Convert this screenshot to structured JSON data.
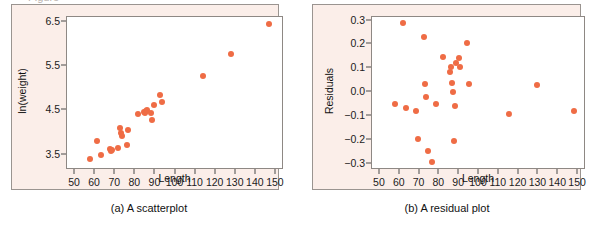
{
  "figure": {
    "background_color": "#ffffff",
    "panel_background_color": "#fbeee9",
    "plot_area_color": "#ffffff",
    "marker_color": "#ef6c45",
    "frame_color": "#9a9490"
  },
  "panels": [
    {
      "id": "scatterplot",
      "caption": "(a) A scatterplot",
      "chart_data": {
        "type": "scatter",
        "title": "",
        "xlabel": "Length",
        "ylabel": "ln(weight)",
        "xlim": [
          46,
          154
        ],
        "ylim": [
          3.15,
          6.62
        ],
        "grid": false,
        "legend": "none",
        "xticks": [
          50,
          60,
          70,
          80,
          90,
          100,
          110,
          120,
          130,
          140,
          150
        ],
        "yticks": [
          3.5,
          4.5,
          5.5,
          6.5
        ],
        "x": [
          57.5,
          61.0,
          63.0,
          67.5,
          68.0,
          68.5,
          71.5,
          72.5,
          73.0,
          73.5,
          76.0,
          76.5,
          81.5,
          84.5,
          85.0,
          85.5,
          86.0,
          88.0,
          88.5,
          89.5,
          92.5,
          93.5,
          113.5,
          127.5,
          146.5
        ],
        "y": [
          3.39,
          3.8,
          3.5,
          3.63,
          3.59,
          3.61,
          3.65,
          4.1,
          4.0,
          3.92,
          3.72,
          4.05,
          4.42,
          4.46,
          4.45,
          4.48,
          4.52,
          4.45,
          4.29,
          4.62,
          4.85,
          4.7,
          5.29,
          5.78,
          6.47
        ]
      }
    },
    {
      "id": "residual-plot",
      "caption": "(b) A residual plot",
      "chart_data": {
        "type": "scatter",
        "title": "",
        "xlabel": "Length",
        "ylabel": "Residuals",
        "xlim": [
          46,
          154
        ],
        "ylim": [
          -0.325,
          0.315
        ],
        "grid": false,
        "legend": "none",
        "xticks": [
          50,
          60,
          70,
          80,
          90,
          100,
          110,
          120,
          130,
          140,
          150
        ],
        "yticks": [
          "0.3",
          "0.2",
          "0.1",
          "0.0",
          "−0.1",
          "−0.2",
          "−0.3"
        ],
        "ytick_values": [
          0.3,
          0.2,
          0.1,
          0.0,
          -0.1,
          -0.2,
          -0.3
        ],
        "x": [
          57.5,
          61.5,
          63.0,
          68.0,
          69.0,
          72.0,
          72.5,
          73.0,
          74.5,
          76.5,
          78.5,
          82.0,
          85.5,
          86.0,
          86.5,
          87.0,
          87.5,
          88.0,
          88.5,
          90.0,
          90.5,
          94.0,
          95.0,
          115.0,
          129.5,
          148.0
        ],
        "y": [
          -0.051,
          0.29,
          -0.067,
          -0.077,
          -0.197,
          0.23,
          0.035,
          -0.021,
          -0.246,
          -0.29,
          -0.048,
          0.147,
          0.086,
          0.104,
          0.04,
          0.001,
          -0.203,
          -0.056,
          0.121,
          0.143,
          0.104,
          0.205,
          0.035,
          -0.091,
          0.03,
          -0.08
        ]
      }
    }
  ],
  "top_cropped_text": "Figure"
}
